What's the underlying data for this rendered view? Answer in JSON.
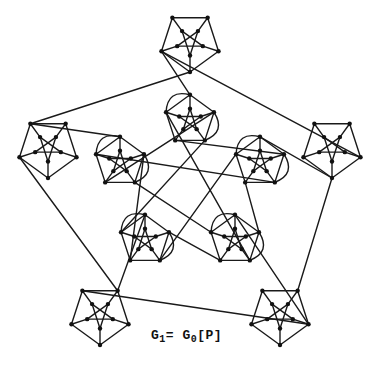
{
  "caption": {
    "G": "G",
    "sub1": "1",
    "eq": "= G",
    "sub0": "0",
    "rest": "[P]"
  },
  "graph": {
    "stroke": "#1a1a1a",
    "node_color": "#111111",
    "outer_centers": [
      [
        190,
        42
      ],
      [
        48,
        148
      ],
      [
        100,
        315
      ],
      [
        280,
        315
      ],
      [
        332,
        148
      ]
    ],
    "outer_radius": 40,
    "inner_centers": [
      [
        190,
        120
      ],
      [
        120,
        162
      ],
      [
        145,
        240
      ],
      [
        235,
        240
      ],
      [
        260,
        162
      ]
    ],
    "inner_radius": 28
  }
}
